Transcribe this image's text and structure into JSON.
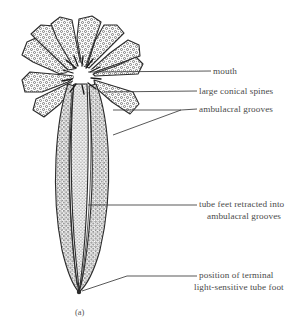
{
  "figure": {
    "caption": "(a)",
    "background_color": "#ffffff",
    "ink_color": "#2b2b2b",
    "text_color": "#4a4a4a"
  },
  "labels": [
    {
      "id": "mouth",
      "text": "mouth",
      "leader": "horizontal-line-to-central-mouth"
    },
    {
      "id": "large-conical-spines",
      "text": "large conical spines",
      "leader": "horizontal-line-to-spines"
    },
    {
      "id": "ambulacral-grooves",
      "text": "ambulacral grooves",
      "leader": "forked-bracket-two-branches"
    },
    {
      "id": "tube-feet-retracted",
      "line1": "tube feet retracted into",
      "line2": "ambulacral grooves",
      "leader": "horizontal-line-to-trunk"
    },
    {
      "id": "terminal-tube-foot",
      "line1": "position of terminal",
      "line2": "light-sensitive tube foot",
      "leader": "elbow-line-to-tip"
    }
  ]
}
